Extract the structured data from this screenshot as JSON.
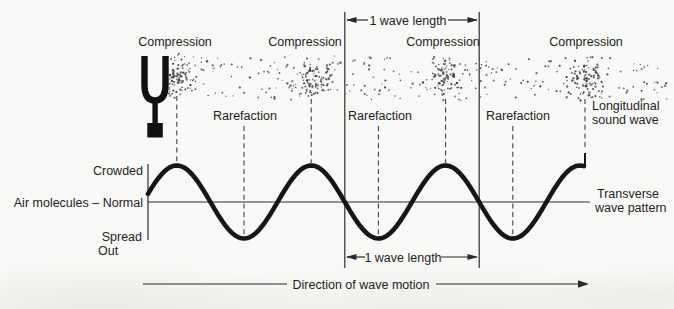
{
  "colors": {
    "background": "#f8f8f6",
    "ink": "#1e1e1e",
    "line": "#2e2e2e",
    "dot": "#3d3d3d",
    "wave": "#161616"
  },
  "labels": {
    "wavelength_top": "1 wave length",
    "wavelength_bottom": "1 wave length",
    "compressions": [
      "Compression",
      "Compression",
      "Compression",
      "Compression"
    ],
    "rarefactions": [
      "Rarefaction",
      "Rarefaction",
      "Rarefaction"
    ],
    "longitudinal_line1": "Longitudinal",
    "longitudinal_line2": "sound wave",
    "transverse_line1": "Transverse",
    "transverse_line2": "wave pattern",
    "crowded": "Crowded",
    "air_molecules_normal": "Air molecules – Normal",
    "spread": "Spread",
    "out": "Out",
    "direction": "Direction of wave motion"
  },
  "wave": {
    "start_x": 148,
    "end_x": 585,
    "midline_y": 202,
    "amplitude": 36.5,
    "wavelength": 134.4,
    "first_crest_x": 176.8,
    "crest_xs": [
      177,
      311,
      446,
      580
    ],
    "trough_xs": [
      244,
      378,
      513
    ]
  },
  "band": {
    "x0": 168,
    "x1": 668,
    "y0": 56,
    "y1": 100,
    "compression_centers": [
      178,
      311,
      446,
      587
    ],
    "sparse_count": 250,
    "cluster_count": 92
  }
}
